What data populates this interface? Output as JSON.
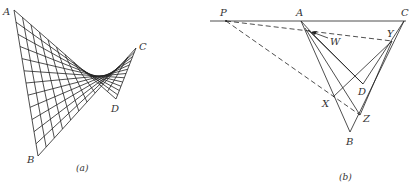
{
  "figure_a": {
    "caption": "(a)",
    "vertices": {
      "A": {
        "label": "A",
        "x": 14,
        "y": 10,
        "lx": 3,
        "ly": 15
      },
      "B": {
        "label": "B",
        "x": 38,
        "y": 156,
        "lx": 27,
        "ly": 163
      },
      "C": {
        "label": "C",
        "x": 136,
        "y": 48,
        "lx": 139,
        "ly": 50
      },
      "D": {
        "label": "D",
        "x": 116,
        "y": 99,
        "lx": 111,
        "ly": 112
      }
    },
    "rulings": 12,
    "description": "Hyperbolic paraboloid ruled surface on skew quadrilateral ADCB"
  },
  "figure_b": {
    "caption": "(b)",
    "points": {
      "P": {
        "label": "P",
        "x": 226,
        "y": 21,
        "lx": 220,
        "ly": 16
      },
      "A": {
        "label": "A",
        "x": 301,
        "y": 21,
        "lx": 296,
        "ly": 16
      },
      "C": {
        "label": "C",
        "x": 404,
        "y": 21,
        "lx": 401,
        "ly": 16
      },
      "W": {
        "label": "W",
        "x": 311,
        "y": 32,
        "lx": 330,
        "ly": 45
      },
      "Y": {
        "label": "Y",
        "x": 392,
        "y": 41,
        "lx": 387,
        "ly": 37
      },
      "D": {
        "label": "D",
        "x": 363,
        "y": 84,
        "lx": 358,
        "ly": 95
      },
      "X": {
        "label": "X",
        "x": 333,
        "y": 97,
        "lx": 322,
        "ly": 107
      },
      "Z": {
        "label": "Z",
        "x": 360,
        "y": 115,
        "lx": 363,
        "ly": 122
      },
      "B": {
        "label": "B",
        "x": 350,
        "y": 132,
        "lx": 346,
        "ly": 145
      }
    }
  }
}
